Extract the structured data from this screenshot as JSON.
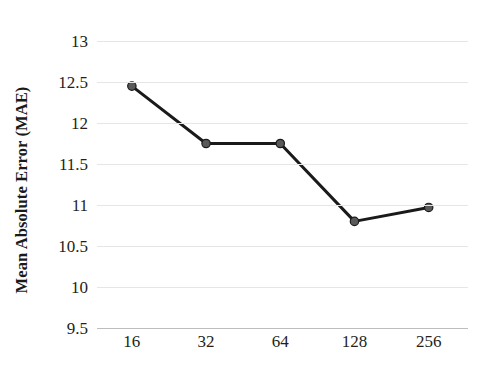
{
  "chart_data": {
    "type": "line",
    "title": "",
    "xlabel": "",
    "ylabel": "Mean Absolute Error (MAE)",
    "categories": [
      "16",
      "32",
      "64",
      "128",
      "256"
    ],
    "values": [
      12.45,
      11.75,
      11.75,
      10.8,
      10.97
    ],
    "series": [
      {
        "name": "MAE",
        "values": [
          12.45,
          11.75,
          11.75,
          10.8,
          10.97
        ]
      }
    ],
    "ylim": [
      9.5,
      13
    ],
    "yticks": [
      "9.5",
      "10",
      "10.5",
      "11",
      "11.5",
      "12",
      "12.5",
      "13"
    ],
    "ytick_values": [
      9.5,
      10,
      10.5,
      11,
      11.5,
      12,
      12.5,
      13
    ],
    "xticks": [
      "16",
      "32",
      "64",
      "128",
      "256"
    ],
    "grid": true,
    "legend": false,
    "legend_position": "none",
    "colors": {
      "line": "#1a1a1a",
      "marker_fill": "#595959",
      "marker_stroke": "#1a1a1a",
      "gridline": "#e6e6e6",
      "axis": "#bdbdbd",
      "text": "#231f20",
      "background": "#ffffff"
    },
    "marker": "circle",
    "line_width": 3
  }
}
